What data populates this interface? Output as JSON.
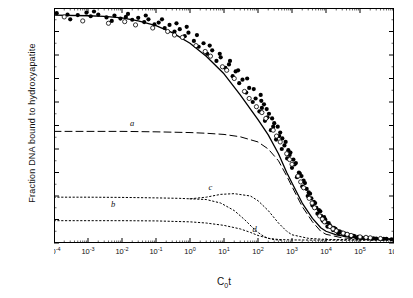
{
  "chart_data": {
    "type": "scatter",
    "title": "",
    "xlabel": "C0t",
    "ylabel": "Fraction DNA bound to hydroxyapatite",
    "xlabel_main": "C",
    "xlabel_sub": "0",
    "xlabel_tail": "t",
    "xscale": "log",
    "xlim": [
      0.0001,
      1000000
    ],
    "ylim": [
      1.0,
      0.0
    ],
    "y_inverted": true,
    "grid": false,
    "legend": "none",
    "xticks": [
      {
        "value": 0.0001,
        "label": "10",
        "exp": "-4"
      },
      {
        "value": 0.001,
        "label": "10",
        "exp": "-3"
      },
      {
        "value": 0.01,
        "label": "10",
        "exp": "-2"
      },
      {
        "value": 0.1,
        "label": "10",
        "exp": "-1"
      },
      {
        "value": 1,
        "label": "10",
        "exp": "0"
      },
      {
        "value": 10,
        "label": "10",
        "exp": "1"
      },
      {
        "value": 100,
        "label": "10",
        "exp": "2"
      },
      {
        "value": 1000,
        "label": "10",
        "exp": "3"
      },
      {
        "value": 10000,
        "label": "10",
        "exp": "4"
      },
      {
        "value": 100000,
        "label": "10",
        "exp": "5"
      },
      {
        "value": 1000000,
        "label": "10",
        "exp": "6"
      }
    ],
    "yticks": [
      {
        "value": 0.0,
        "label": "0"
      },
      {
        "value": 0.1,
        "label": "0.1"
      },
      {
        "value": 0.2,
        "label": "0.2"
      },
      {
        "value": 0.3,
        "label": "0.3"
      },
      {
        "value": 0.4,
        "label": "0.4"
      },
      {
        "value": 0.5,
        "label": "0.5"
      },
      {
        "value": 0.6,
        "label": "0.6"
      },
      {
        "value": 0.7,
        "label": "0.7"
      },
      {
        "value": 0.8,
        "label": "0.8"
      },
      {
        "value": 0.9,
        "label": "0.9"
      },
      {
        "value": 1.0,
        "label": "1.0"
      }
    ],
    "annotations": [
      {
        "name": "curve-label-a",
        "text": "a",
        "x": 0.02,
        "y": 0.5
      },
      {
        "name": "curve-label-b",
        "text": "b",
        "x": 0.0055,
        "y": 0.845
      },
      {
        "name": "curve-label-c",
        "text": "c",
        "x": 4.0,
        "y": 0.775
      },
      {
        "name": "curve-label-d",
        "text": "d",
        "x": 80,
        "y": 0.955
      }
    ],
    "series": [
      {
        "name": "curve-a-dashed",
        "style": "dashed",
        "points": [
          [
            0.0001,
            0.525
          ],
          [
            0.001,
            0.525
          ],
          [
            0.01,
            0.525
          ],
          [
            0.1,
            0.527
          ],
          [
            1,
            0.53
          ],
          [
            3,
            0.533
          ],
          [
            10,
            0.538
          ],
          [
            30,
            0.548
          ],
          [
            100,
            0.57
          ],
          [
            200,
            0.6
          ],
          [
            400,
            0.65
          ],
          [
            700,
            0.715
          ],
          [
            1000,
            0.76
          ],
          [
            2000,
            0.845
          ],
          [
            4000,
            0.91
          ],
          [
            7000,
            0.95
          ],
          [
            10000,
            0.963
          ],
          [
            30000,
            0.978
          ],
          [
            100000,
            0.983
          ],
          [
            1000000,
            0.985
          ]
        ]
      },
      {
        "name": "curve-b-dotted",
        "style": "dotted",
        "points": [
          [
            0.0001,
            0.905
          ],
          [
            0.001,
            0.905
          ],
          [
            0.01,
            0.905
          ],
          [
            0.1,
            0.906
          ],
          [
            1,
            0.91
          ],
          [
            3,
            0.915
          ],
          [
            10,
            0.925
          ],
          [
            30,
            0.94
          ],
          [
            60,
            0.955
          ],
          [
            100,
            0.968
          ],
          [
            200,
            0.98
          ],
          [
            400,
            0.985
          ],
          [
            1000,
            0.987
          ],
          [
            10000,
            0.988
          ],
          [
            1000000,
            0.988
          ]
        ]
      },
      {
        "name": "curve-c-dotted",
        "style": "dotted",
        "points": [
          [
            0.0001,
            0.805
          ],
          [
            0.001,
            0.805
          ],
          [
            0.01,
            0.806
          ],
          [
            0.1,
            0.808
          ],
          [
            0.5,
            0.81
          ],
          [
            1,
            0.812
          ],
          [
            3,
            0.805
          ],
          [
            8,
            0.793
          ],
          [
            20,
            0.79
          ],
          [
            60,
            0.8
          ],
          [
            100,
            0.82
          ],
          [
            200,
            0.862
          ],
          [
            400,
            0.915
          ],
          [
            700,
            0.95
          ],
          [
            1000,
            0.965
          ],
          [
            3000,
            0.98
          ],
          [
            10000,
            0.985
          ],
          [
            1000000,
            0.987
          ]
        ]
      },
      {
        "name": "curve-d-dotted",
        "style": "dotted",
        "points": [
          [
            1,
            0.812
          ],
          [
            3,
            0.815
          ],
          [
            8,
            0.83
          ],
          [
            20,
            0.862
          ],
          [
            40,
            0.9
          ],
          [
            70,
            0.935
          ],
          [
            100,
            0.955
          ],
          [
            150,
            0.972
          ],
          [
            200,
            0.98
          ],
          [
            300,
            0.986
          ],
          [
            500,
            0.988
          ]
        ]
      },
      {
        "name": "curve-main-solid",
        "style": "solid",
        "points": [
          [
            0.0001,
            0.03
          ],
          [
            0.001,
            0.033
          ],
          [
            0.003,
            0.036
          ],
          [
            0.01,
            0.042
          ],
          [
            0.03,
            0.055
          ],
          [
            0.1,
            0.075
          ],
          [
            0.3,
            0.105
          ],
          [
            1,
            0.15
          ],
          [
            3,
            0.205
          ],
          [
            10,
            0.28
          ],
          [
            30,
            0.37
          ],
          [
            100,
            0.475
          ],
          [
            200,
            0.54
          ],
          [
            400,
            0.62
          ],
          [
            700,
            0.7
          ],
          [
            1000,
            0.745
          ],
          [
            2000,
            0.83
          ],
          [
            4000,
            0.895
          ],
          [
            7000,
            0.935
          ],
          [
            10000,
            0.95
          ],
          [
            20000,
            0.965
          ],
          [
            50000,
            0.975
          ],
          [
            100000,
            0.98
          ],
          [
            1000000,
            0.983
          ]
        ]
      }
    ],
    "scatter_filled": {
      "name": "filled-circles",
      "marker": "filled-circle",
      "points": [
        [
          0.00012,
          0.022
        ],
        [
          0.00025,
          0.028
        ],
        [
          0.0005,
          0.03
        ],
        [
          0.0009,
          0.02
        ],
        [
          0.0012,
          0.035
        ],
        [
          0.002,
          0.028
        ],
        [
          0.0035,
          0.04
        ],
        [
          0.006,
          0.032
        ],
        [
          0.009,
          0.045
        ],
        [
          0.013,
          0.038
        ],
        [
          0.02,
          0.05
        ],
        [
          0.03,
          0.042
        ],
        [
          0.045,
          0.06
        ],
        [
          0.06,
          0.048
        ],
        [
          0.09,
          0.07
        ],
        [
          0.12,
          0.062
        ],
        [
          0.18,
          0.085
        ],
        [
          0.25,
          0.072
        ],
        [
          0.35,
          0.1
        ],
        [
          0.5,
          0.09
        ],
        [
          0.7,
          0.12
        ],
        [
          0.9,
          0.105
        ],
        [
          1.3,
          0.14
        ],
        [
          1.8,
          0.165
        ],
        [
          2.5,
          0.15
        ],
        [
          3.2,
          0.195
        ],
        [
          4.5,
          0.18
        ],
        [
          6,
          0.225
        ],
        [
          8,
          0.21
        ],
        [
          11,
          0.255
        ],
        [
          14,
          0.24
        ],
        [
          18,
          0.29
        ],
        [
          22,
          0.27
        ],
        [
          28,
          0.32
        ],
        [
          35,
          0.305
        ],
        [
          45,
          0.36
        ],
        [
          55,
          0.34
        ],
        [
          70,
          0.4
        ],
        [
          85,
          0.385
        ],
        [
          110,
          0.44
        ],
        [
          130,
          0.425
        ],
        [
          160,
          0.48
        ],
        [
          190,
          0.465
        ],
        [
          240,
          0.52
        ],
        [
          280,
          0.505
        ],
        [
          340,
          0.56
        ],
        [
          420,
          0.545
        ],
        [
          500,
          0.6
        ],
        [
          600,
          0.585
        ],
        [
          720,
          0.64
        ],
        [
          850,
          0.625
        ],
        [
          1000,
          0.68
        ],
        [
          1200,
          0.665
        ],
        [
          1400,
          0.72
        ],
        [
          1700,
          0.705
        ],
        [
          2000,
          0.76
        ],
        [
          2400,
          0.745
        ],
        [
          2900,
          0.8
        ],
        [
          3400,
          0.79
        ],
        [
          4000,
          0.84
        ],
        [
          4800,
          0.83
        ],
        [
          5600,
          0.875
        ],
        [
          6800,
          0.865
        ],
        [
          8000,
          0.905
        ],
        [
          9500,
          0.9
        ],
        [
          11000,
          0.93
        ],
        [
          13000,
          0.925
        ],
        [
          16000,
          0.945
        ],
        [
          19000,
          0.94
        ],
        [
          23000,
          0.958
        ],
        [
          28000,
          0.955
        ],
        [
          34000,
          0.965
        ],
        [
          42000,
          0.962
        ],
        [
          52000,
          0.972
        ],
        [
          65000,
          0.97
        ],
        [
          80000,
          0.978
        ],
        [
          100000,
          0.976
        ],
        [
          130000,
          0.98
        ],
        [
          170000,
          0.979
        ],
        [
          220000,
          0.982
        ],
        [
          300000,
          0.981
        ],
        [
          420000,
          0.983
        ],
        [
          600000,
          0.982
        ],
        [
          850000,
          0.984
        ],
        [
          0.0003,
          0.048
        ],
        [
          0.0015,
          0.015
        ],
        [
          0.005,
          0.055
        ],
        [
          0.015,
          0.025
        ],
        [
          0.05,
          0.032
        ],
        [
          0.15,
          0.048
        ],
        [
          0.4,
          0.065
        ],
        [
          0.8,
          0.08
        ],
        [
          1.6,
          0.115
        ],
        [
          3.8,
          0.16
        ],
        [
          7.5,
          0.195
        ],
        [
          15,
          0.225
        ],
        [
          26,
          0.265
        ],
        [
          48,
          0.3
        ],
        [
          75,
          0.345
        ],
        [
          125,
          0.395
        ],
        [
          180,
          0.43
        ],
        [
          260,
          0.47
        ],
        [
          380,
          0.505
        ],
        [
          520,
          0.555
        ],
        [
          780,
          0.605
        ],
        [
          1100,
          0.645
        ],
        [
          1600,
          0.7
        ],
        [
          2200,
          0.735
        ],
        [
          3100,
          0.785
        ],
        [
          4400,
          0.825
        ],
        [
          6200,
          0.86
        ],
        [
          8800,
          0.89
        ],
        [
          12000,
          0.915
        ],
        [
          17000,
          0.935
        ],
        [
          25000,
          0.95
        ],
        [
          36000,
          0.96
        ],
        [
          55000,
          0.968
        ],
        [
          90000,
          0.974
        ],
        [
          150000,
          0.978
        ],
        [
          250000,
          0.98
        ],
        [
          500000,
          0.982
        ],
        [
          120,
          0.37
        ],
        [
          150,
          0.41
        ],
        [
          210,
          0.45
        ],
        [
          300,
          0.49
        ],
        [
          450,
          0.53
        ],
        [
          650,
          0.57
        ],
        [
          900,
          0.615
        ],
        [
          1300,
          0.66
        ],
        [
          1900,
          0.715
        ],
        [
          2700,
          0.77
        ],
        [
          3700,
          0.81
        ],
        [
          5200,
          0.85
        ],
        [
          7200,
          0.885
        ],
        [
          10000,
          0.912
        ],
        [
          14000,
          0.932
        ],
        [
          21000,
          0.948
        ],
        [
          30000,
          0.958
        ],
        [
          46000,
          0.966
        ],
        [
          70000,
          0.972
        ],
        [
          110000,
          0.977
        ]
      ]
    },
    "scatter_open": {
      "name": "open-circles",
      "marker": "open-circle",
      "points": [
        [
          0.0007,
          0.055
        ],
        [
          0.004,
          0.065
        ],
        [
          0.025,
          0.072
        ],
        [
          0.08,
          0.085
        ],
        [
          0.22,
          0.1
        ],
        [
          0.6,
          0.125
        ],
        [
          1.5,
          0.16
        ],
        [
          4,
          0.205
        ],
        [
          9,
          0.25
        ],
        [
          20,
          0.3
        ],
        [
          40,
          0.355
        ],
        [
          90,
          0.42
        ],
        [
          170,
          0.47
        ],
        [
          280,
          0.52
        ],
        [
          450,
          0.57
        ],
        [
          700,
          0.62
        ],
        [
          1000,
          0.665
        ],
        [
          1500,
          0.715
        ],
        [
          2200,
          0.765
        ],
        [
          3200,
          0.81
        ],
        [
          4600,
          0.85
        ],
        [
          6500,
          0.885
        ],
        [
          9000,
          0.91
        ],
        [
          13000,
          0.93
        ],
        [
          20000,
          0.948
        ],
        [
          32000,
          0.958
        ],
        [
          55000,
          0.968
        ],
        [
          100000,
          0.974
        ],
        [
          200000,
          0.978
        ],
        [
          400000,
          0.981
        ],
        [
          0.0002,
          0.038
        ],
        [
          0.012,
          0.058
        ],
        [
          0.35,
          0.115
        ],
        [
          2.8,
          0.185
        ],
        [
          12,
          0.265
        ],
        [
          55,
          0.385
        ],
        [
          130,
          0.445
        ],
        [
          350,
          0.545
        ],
        [
          850,
          0.645
        ],
        [
          1800,
          0.74
        ],
        [
          3900,
          0.83
        ],
        [
          7800,
          0.898
        ],
        [
          16000,
          0.94
        ],
        [
          42000,
          0.963
        ],
        [
          150000,
          0.976
        ]
      ]
    }
  }
}
